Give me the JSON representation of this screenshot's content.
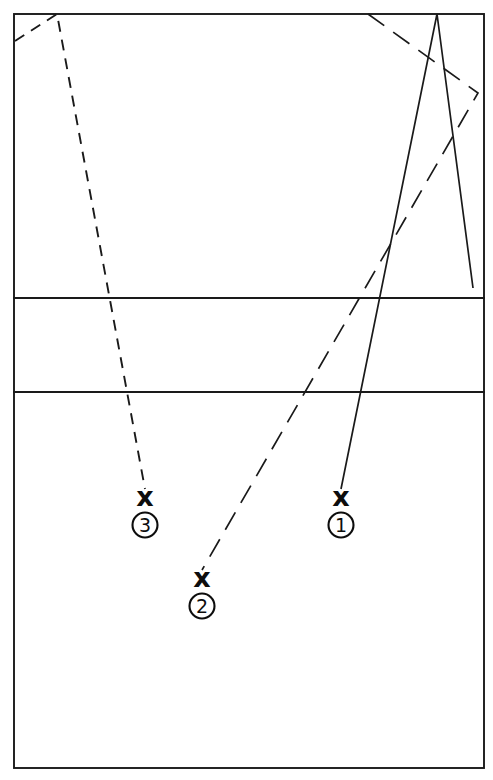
{
  "diagram": {
    "canvas": {
      "width": 493,
      "height": 780,
      "background": "#ffffff"
    },
    "ink_color": "#1a1a1a",
    "field": {
      "name": "field-outline",
      "left": 14,
      "top": 14,
      "right": 484,
      "bottom": 768,
      "divider_y": [
        298,
        392
      ],
      "zone_labels": []
    },
    "markers": [
      {
        "id": "1",
        "label": "①",
        "number_text": "1",
        "x_glyph": "x",
        "x_pos": {
          "x": 341,
          "y": 497
        },
        "circle_pos": {
          "x": 341,
          "y": 525
        },
        "circle_radius": 12.5
      },
      {
        "id": "2",
        "label": "②",
        "number_text": "2",
        "x_glyph": "x",
        "x_pos": {
          "x": 202,
          "y": 578
        },
        "circle_pos": {
          "x": 202,
          "y": 606
        },
        "circle_radius": 12.5
      },
      {
        "id": "3",
        "label": "③",
        "number_text": "3",
        "x_glyph": "x",
        "x_pos": {
          "x": 145,
          "y": 497
        },
        "circle_pos": {
          "x": 145,
          "y": 525
        },
        "circle_radius": 12.5
      }
    ],
    "trajectories": [
      {
        "name": "trajectory-1",
        "style": "solid",
        "marker_ref": "1",
        "points": [
          [
            473,
            288
          ],
          [
            437,
            14
          ],
          [
            341,
            489
          ]
        ]
      },
      {
        "name": "trajectory-2",
        "style": "dash-dot",
        "marker_ref": "2",
        "points": [
          [
            368,
            14
          ],
          [
            478,
            93
          ],
          [
            202,
            570
          ]
        ]
      },
      {
        "name": "trajectory-3",
        "style": "dashed",
        "marker_ref": "3",
        "points": [
          [
            15,
            41
          ],
          [
            57,
            14
          ],
          [
            145,
            489
          ]
        ]
      }
    ]
  }
}
